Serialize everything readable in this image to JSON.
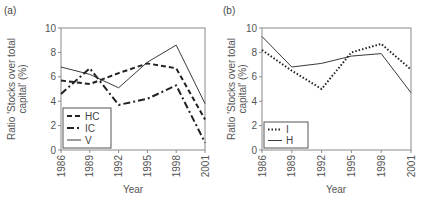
{
  "chart_data": [
    {
      "type": "line",
      "panel_label": "(a)",
      "title": "",
      "xlabel": "Year",
      "ylabel": "Ratio 'Stocks over total capital' (%)",
      "ylabel_lines": [
        "Ratio 'Stocks over total",
        "capital' (%)"
      ],
      "x": [
        "1986",
        "1989",
        "1992",
        "1995",
        "1998",
        "2001"
      ],
      "ylim": [
        0,
        10
      ],
      "yticks": [
        0,
        2,
        4,
        6,
        8,
        10
      ],
      "grid": false,
      "legend_position": "lower left",
      "series": [
        {
          "name": "HC",
          "style": "dashed",
          "values": [
            5.7,
            5.4,
            6.3,
            7.1,
            6.7,
            2.5
          ]
        },
        {
          "name": "IC",
          "style": "dash-dot",
          "values": [
            4.6,
            6.7,
            3.7,
            4.2,
            5.3,
            0.6
          ]
        },
        {
          "name": "V",
          "style": "solid-thin",
          "values": [
            6.8,
            6.2,
            5.1,
            7.2,
            8.6,
            3.8
          ]
        }
      ]
    },
    {
      "type": "line",
      "panel_label": "(b)",
      "title": "",
      "xlabel": "Year",
      "ylabel": "Ratio 'Stocks over total capital' (%)",
      "ylabel_lines": [
        "Ratio 'Stocks over total",
        "capital' (%)"
      ],
      "x": [
        "1986",
        "1989",
        "1992",
        "1995",
        "1998",
        "2001"
      ],
      "ylim": [
        0,
        10
      ],
      "yticks": [
        0,
        2,
        4,
        6,
        8,
        10
      ],
      "grid": false,
      "legend_position": "lower left",
      "series": [
        {
          "name": "I",
          "style": "dotted",
          "values": [
            8.2,
            6.5,
            5.0,
            8.0,
            8.7,
            6.6
          ]
        },
        {
          "name": "H",
          "style": "solid-thin",
          "values": [
            9.3,
            6.8,
            7.1,
            7.7,
            7.9,
            4.7
          ]
        }
      ]
    }
  ],
  "colors": {
    "line": "#222222",
    "axis": "#777777",
    "text": "#555555"
  }
}
